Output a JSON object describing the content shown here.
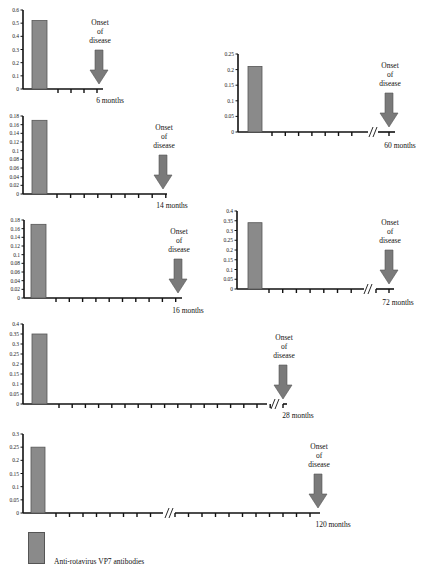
{
  "colors": {
    "bar": "#8a8a8a",
    "bar_stroke": "#555555",
    "arrow": "#7a7a7a",
    "axis": "#111111"
  },
  "legend": {
    "label": "Anti-rotavirus VP7 antibodies"
  },
  "onset_text": [
    "Onset",
    "of",
    "disease"
  ],
  "chart_data": [
    {
      "type": "bar",
      "title": "",
      "xlabel": "6 months",
      "ylabel": "",
      "ylim": [
        0,
        0.6
      ],
      "yticks": [
        "0",
        "0.1",
        "0.2",
        "0.3",
        "0.4",
        "0.5",
        "0.6"
      ],
      "categories": [
        "baseline"
      ],
      "values": [
        0.52
      ],
      "x_ticks_after_bar": 4,
      "axis_break": false,
      "annotation": "Onset of disease",
      "layout": {
        "x0": 23,
        "yTop": 10,
        "yBot": 89,
        "xEnd": 103,
        "barX": 32,
        "barW": 15,
        "tickStart": 58,
        "tickStep": 13,
        "labelX": 110,
        "labelY": 103,
        "breakAt": null,
        "postTicks": 0
      }
    },
    {
      "type": "bar",
      "title": "",
      "xlabel": "14 months",
      "ylabel": "",
      "ylim": [
        0,
        0.18
      ],
      "yticks": [
        "0",
        "0.02",
        "0.04",
        "0.06",
        "0.08",
        "0.1",
        "0.12",
        "0.14",
        "0.16",
        "0.18"
      ],
      "categories": [
        "baseline"
      ],
      "values": [
        0.17
      ],
      "x_ticks_after_bar": 9,
      "axis_break": false,
      "annotation": "Onset of disease",
      "layout": {
        "x0": 23,
        "yTop": 116,
        "yBot": 194,
        "xEnd": 167,
        "barX": 32,
        "barW": 15,
        "tickStart": 57,
        "tickStep": 13.6,
        "labelX": 172,
        "labelY": 208,
        "breakAt": null,
        "postTicks": 0
      }
    },
    {
      "type": "bar",
      "title": "",
      "xlabel": "16 months",
      "ylabel": "",
      "ylim": [
        0,
        0.18
      ],
      "yticks": [
        "0",
        "0.02",
        "0.04",
        "0.06",
        "0.08",
        "0.1",
        "0.12",
        "0.14",
        "0.16",
        "0.18"
      ],
      "categories": [
        "baseline"
      ],
      "values": [
        0.17
      ],
      "x_ticks_after_bar": 10,
      "axis_break": false,
      "annotation": "Onset of disease",
      "layout": {
        "x0": 24,
        "yTop": 220,
        "yBot": 298,
        "xEnd": 182,
        "barX": 31,
        "barW": 15,
        "tickStart": 56,
        "tickStep": 13.3,
        "labelX": 188,
        "labelY": 313,
        "breakAt": null,
        "postTicks": 0
      }
    },
    {
      "type": "bar",
      "title": "",
      "xlabel": "28 months",
      "ylabel": "",
      "ylim": [
        0,
        0.4
      ],
      "yticks": [
        "0",
        "0.05",
        "0.1",
        "0.15",
        "0.2",
        "0.25",
        "0.3",
        "0.35",
        "0.4"
      ],
      "categories": [
        "baseline"
      ],
      "values": [
        0.35
      ],
      "x_ticks_after_bar": 17,
      "axis_break": true,
      "annotation": "Onset of disease",
      "layout": {
        "x0": 23,
        "yTop": 324,
        "yBot": 404,
        "xEnd": 267,
        "barX": 32,
        "barW": 15,
        "tickStart": 59,
        "tickStep": 13.2,
        "labelX": 298,
        "labelY": 418,
        "breakAt": 274,
        "postTicks": 1,
        "postStart": 283,
        "postEnd": 287
      }
    },
    {
      "type": "bar",
      "title": "",
      "xlabel": "120 months",
      "ylabel": "",
      "ylim": [
        0,
        0.3
      ],
      "yticks": [
        "0",
        "0.05",
        "0.1",
        "0.15",
        "0.2",
        "0.25",
        "0.3"
      ],
      "categories": [
        "baseline"
      ],
      "values": [
        0.25
      ],
      "x_ticks_after_bar": 8,
      "axis_break": true,
      "annotation": "Onset of disease",
      "layout": {
        "x0": 23,
        "yTop": 434,
        "yBot": 513,
        "xEnd": 163,
        "barX": 31,
        "barW": 14,
        "tickStart": 56,
        "tickStep": 13.5,
        "labelX": 333,
        "labelY": 527,
        "breakAt": 168,
        "postTicks": 11,
        "postStart": 175,
        "postEnd": 320,
        "postTickStart": 175,
        "postTickStep": 13.5
      }
    },
    {
      "type": "bar",
      "title": "",
      "xlabel": "60 months",
      "ylabel": "",
      "ylim": [
        0,
        0.25
      ],
      "yticks": [
        "0",
        "0.05",
        "0.1",
        "0.15",
        "0.2",
        "0.25"
      ],
      "categories": [
        "baseline"
      ],
      "values": [
        0.21
      ],
      "x_ticks_after_bar": 7,
      "axis_break": true,
      "annotation": "Onset of disease",
      "layout": {
        "x0": 238,
        "yTop": 54,
        "yBot": 132,
        "xEnd": 368,
        "barX": 248,
        "barW": 14,
        "tickStart": 272,
        "tickStep": 13.3,
        "labelX": 400,
        "labelY": 148,
        "breakAt": 372,
        "postTicks": 1,
        "postStart": 378,
        "postEnd": 395,
        "postTickStart": 389,
        "postTickStep": 13
      }
    },
    {
      "type": "bar",
      "title": "",
      "xlabel": "72 months",
      "ylabel": "",
      "ylim": [
        0,
        0.4
      ],
      "yticks": [
        "0",
        "0.05",
        "0.1",
        "0.15",
        "0.2",
        "0.25",
        "0.3",
        "0.35",
        "0.4"
      ],
      "categories": [
        "baseline"
      ],
      "values": [
        0.34
      ],
      "x_ticks_after_bar": 7,
      "axis_break": true,
      "annotation": "Onset of disease",
      "layout": {
        "x0": 237,
        "yTop": 211,
        "yBot": 289,
        "xEnd": 364,
        "barX": 248,
        "barW": 14,
        "tickStart": 269,
        "tickStep": 13.7,
        "labelX": 398,
        "labelY": 305,
        "breakAt": 367,
        "postTicks": 2,
        "postStart": 376,
        "postEnd": 394,
        "postTickStart": 376,
        "postTickStep": 13
      }
    }
  ]
}
